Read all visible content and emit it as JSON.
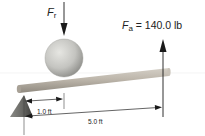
{
  "diagram": {
    "type": "lever",
    "forces": {
      "resistance": {
        "symbol": "F",
        "subscript": "r",
        "direction": "down"
      },
      "applied": {
        "symbol": "F",
        "subscript": "a",
        "equals": " = 140.0 lb",
        "value": 140.0,
        "unit": "lb",
        "direction": "up"
      }
    },
    "dimensions": [
      {
        "label": "1.0 ft",
        "value": 1.0,
        "unit": "ft",
        "from": "fulcrum",
        "to": "resistance"
      },
      {
        "label": "5.0 ft",
        "value": 5.0,
        "unit": "ft",
        "from": "fulcrum",
        "to": "applied"
      }
    ],
    "parts": [
      "fulcrum",
      "beam",
      "sphere-load"
    ],
    "colors": {
      "beam": "#b8b2a8",
      "sphere": "#c8c8c4",
      "fulcrum": "#5a5a5a",
      "arrow": "#1a1a1a"
    }
  }
}
